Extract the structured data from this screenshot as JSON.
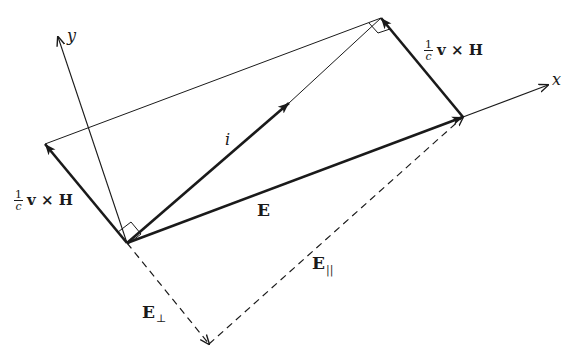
{
  "figure": {
    "type": "vector-diagram",
    "points": {
      "origin": [
        127,
        243
      ],
      "E_tip": [
        463,
        117
      ],
      "top_vertex": [
        381,
        18
      ],
      "left_vertex": [
        45,
        144
      ],
      "perp_corner": [
        209,
        344
      ],
      "i_arrow": [
        289,
        103
      ],
      "x_axis_end": [
        548,
        85
      ],
      "y_axis_end": [
        58,
        37
      ]
    },
    "colors": {
      "ink": "#1a1a1a",
      "background": "#ffffff"
    }
  },
  "labels": {
    "x_axis": "x",
    "y_axis": "y",
    "i_vector": "i",
    "E_vector": "E",
    "E_parallel_main": "E",
    "E_parallel_sub": "||",
    "E_perp_main": "E",
    "E_perp_sub": "⊥",
    "vxh_right": {
      "num": "1",
      "den": "c",
      "expr": "v × H"
    },
    "vxh_left": {
      "num": "1",
      "den": "c",
      "expr": "v × H"
    }
  }
}
